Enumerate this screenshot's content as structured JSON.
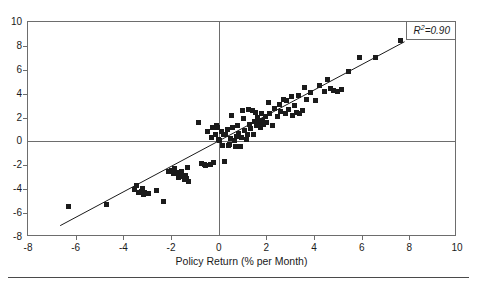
{
  "page": {
    "clipped_caption": "",
    "bleed_text": "",
    "footer_rule": true
  },
  "chart_data": {
    "type": "scatter",
    "title": "",
    "xlabel": "Policy Return (% per Month)",
    "ylabel": "",
    "xlim": [
      -8,
      10
    ],
    "ylim": [
      -8,
      10
    ],
    "xticks": [
      -8,
      -6,
      -4,
      -2,
      0,
      2,
      4,
      6,
      8,
      10
    ],
    "yticks": [
      -8,
      -6,
      -4,
      -2,
      0,
      2,
      4,
      6,
      8,
      10
    ],
    "xtick_labels": [
      "-8",
      "-6",
      "-4",
      "-2",
      "0",
      "2",
      "4",
      "6",
      "8",
      "10"
    ],
    "ytick_labels": [
      "-8",
      "-6",
      "-4",
      "-2",
      "0",
      "2",
      "4",
      "6",
      "8",
      "10"
    ],
    "grid": false,
    "zero_lines": true,
    "legend": "none",
    "annotations": [
      {
        "name": "r-squared",
        "text": "R²=0.90",
        "symbol": "R",
        "superscript": "2",
        "equals": "=",
        "value": "0.90",
        "position": "top-right"
      }
    ],
    "marker": {
      "shape": "square",
      "color": "#1b1b1b",
      "size_px": 5
    },
    "fit_line": {
      "name": "regression-line",
      "color": "#1b1b1b",
      "width_px": 1,
      "x0": -6.65,
      "y0": -7.05,
      "x1": 7.8,
      "y1": 8.35,
      "slope": 1.066,
      "intercept": 0.04
    },
    "n_points": 112,
    "points": [
      [
        -6.3,
        -5.45
      ],
      [
        -4.7,
        -5.25
      ],
      [
        -3.55,
        -4.05
      ],
      [
        -3.45,
        -3.7
      ],
      [
        -3.35,
        -4.3
      ],
      [
        -3.25,
        -4.2
      ],
      [
        -3.2,
        -3.95
      ],
      [
        -3.15,
        -4.45
      ],
      [
        -3.1,
        -4.3
      ],
      [
        -2.95,
        -4.35
      ],
      [
        -2.6,
        -4.1
      ],
      [
        -2.3,
        -5.0
      ],
      [
        -2.1,
        -2.55
      ],
      [
        -2.0,
        -2.4
      ],
      [
        -1.9,
        -2.7
      ],
      [
        -1.85,
        -2.3
      ],
      [
        -1.75,
        -2.6
      ],
      [
        -1.7,
        -3.0
      ],
      [
        -1.6,
        -2.95
      ],
      [
        -1.55,
        -2.5
      ],
      [
        -1.45,
        -3.2
      ],
      [
        -1.4,
        -2.85
      ],
      [
        -1.35,
        -3.1
      ],
      [
        -1.3,
        -2.2
      ],
      [
        -1.25,
        -3.35
      ],
      [
        -0.85,
        1.6
      ],
      [
        -0.7,
        -1.85
      ],
      [
        -0.6,
        -1.9
      ],
      [
        -0.55,
        -2.05
      ],
      [
        -0.45,
        0.85
      ],
      [
        -0.35,
        -1.9
      ],
      [
        -0.3,
        0.3
      ],
      [
        -0.25,
        1.15
      ],
      [
        -0.2,
        -1.75
      ],
      [
        -0.15,
        0.55
      ],
      [
        -0.1,
        1.35
      ],
      [
        -0.05,
        1.2
      ],
      [
        0.0,
        0.2
      ],
      [
        0.05,
        0.1
      ],
      [
        0.1,
        0.85
      ],
      [
        0.15,
        -0.35
      ],
      [
        0.2,
        0.55
      ],
      [
        0.25,
        -1.7
      ],
      [
        0.3,
        0.6
      ],
      [
        0.35,
        1.0
      ],
      [
        0.4,
        -0.3
      ],
      [
        0.45,
        -0.25
      ],
      [
        0.5,
        0.25
      ],
      [
        0.55,
        2.2
      ],
      [
        0.6,
        1.15
      ],
      [
        0.65,
        0.1
      ],
      [
        0.7,
        -0.4
      ],
      [
        0.75,
        0.45
      ],
      [
        0.8,
        1.35
      ],
      [
        0.85,
        0.7
      ],
      [
        0.9,
        -0.45
      ],
      [
        0.95,
        0.3
      ],
      [
        1.0,
        2.6
      ],
      [
        1.05,
        1.9
      ],
      [
        1.1,
        0.9
      ],
      [
        1.15,
        0.15
      ],
      [
        1.2,
        0.6
      ],
      [
        1.25,
        2.7
      ],
      [
        1.3,
        1.45
      ],
      [
        1.35,
        1.05
      ],
      [
        1.4,
        2.55
      ],
      [
        1.45,
        0.55
      ],
      [
        1.5,
        1.7
      ],
      [
        1.55,
        2.45
      ],
      [
        1.6,
        1.3
      ],
      [
        1.65,
        2.0
      ],
      [
        1.7,
        1.55
      ],
      [
        1.75,
        1.2
      ],
      [
        1.8,
        2.35
      ],
      [
        1.85,
        1.75
      ],
      [
        1.9,
        1.45
      ],
      [
        1.95,
        2.1
      ],
      [
        2.0,
        1.6
      ],
      [
        2.1,
        3.3
      ],
      [
        2.15,
        2.3
      ],
      [
        2.25,
        1.35
      ],
      [
        2.35,
        2.8
      ],
      [
        2.45,
        2.05
      ],
      [
        2.55,
        3.1
      ],
      [
        2.6,
        2.5
      ],
      [
        2.7,
        3.55
      ],
      [
        2.8,
        2.35
      ],
      [
        2.85,
        3.4
      ],
      [
        2.95,
        2.7
      ],
      [
        3.05,
        3.75
      ],
      [
        3.1,
        2.15
      ],
      [
        3.2,
        3.05
      ],
      [
        3.25,
        2.45
      ],
      [
        3.35,
        3.85
      ],
      [
        3.4,
        2.3
      ],
      [
        3.5,
        2.6
      ],
      [
        3.6,
        4.55
      ],
      [
        3.7,
        3.55
      ],
      [
        3.85,
        4.1
      ],
      [
        4.05,
        3.45
      ],
      [
        4.25,
        4.7
      ],
      [
        4.45,
        4.2
      ],
      [
        4.55,
        5.15
      ],
      [
        4.7,
        4.45
      ],
      [
        4.8,
        4.3
      ],
      [
        5.0,
        4.2
      ],
      [
        5.15,
        4.35
      ],
      [
        5.45,
        5.85
      ],
      [
        5.9,
        7.05
      ],
      [
        6.6,
        7.0
      ],
      [
        7.65,
        8.45
      ]
    ]
  }
}
